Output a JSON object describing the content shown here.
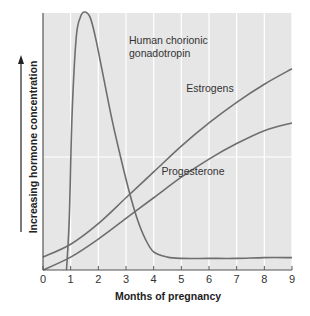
{
  "chart_data": {
    "type": "line",
    "title": "",
    "xlabel": "Months of pregnancy",
    "ylabel": "Increasing hormone concentration",
    "x_ticks": [
      "0",
      "1",
      "2",
      "3",
      "4",
      "5",
      "6",
      "7",
      "8",
      "9"
    ],
    "xlim": [
      0,
      9
    ],
    "ylim": [
      0,
      100
    ],
    "grid": true,
    "legend": "inline labels",
    "series": [
      {
        "name": "Human chorionic gonadotropin",
        "label_lines": [
          "Human chorionic",
          "gonadotropin"
        ],
        "x": [
          0.85,
          0.95,
          1.05,
          1.2,
          1.35,
          1.5,
          1.7,
          1.9,
          2.2,
          2.5,
          2.8,
          3.1,
          3.4,
          3.7,
          4.0,
          4.5,
          5.0,
          6.0,
          7.0,
          8.0,
          9.0
        ],
        "values": [
          0,
          20,
          60,
          90,
          98,
          100,
          98,
          90,
          74,
          58,
          44,
          31,
          20,
          12,
          7,
          5,
          4.5,
          4.5,
          4.5,
          4.8,
          4.8
        ]
      },
      {
        "name": "Estrogens",
        "label_lines": [
          "Estrogens"
        ],
        "x": [
          0,
          1,
          2,
          3,
          4,
          5,
          6,
          7,
          8,
          9
        ],
        "values": [
          5,
          10,
          18,
          28,
          38,
          48,
          57,
          65,
          72,
          78
        ]
      },
      {
        "name": "Progesterone",
        "label_lines": [
          "Progesterone"
        ],
        "x": [
          0,
          1,
          2,
          3,
          4,
          5,
          6,
          7,
          8,
          9
        ],
        "values": [
          0,
          5,
          12,
          20,
          28,
          36,
          43,
          49,
          54,
          57
        ]
      }
    ]
  },
  "colors": {
    "plot_background": "#e6e6e6",
    "gridline": "#ffffff",
    "curve": "#6e6e6e",
    "axis": "#555555"
  }
}
